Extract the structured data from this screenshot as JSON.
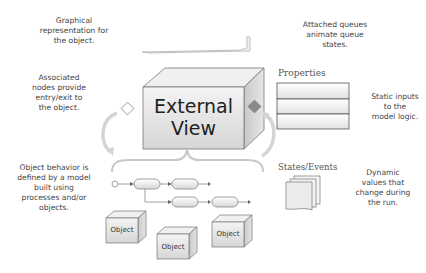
{
  "annotations": {
    "graphical": "Graphical representation for the object.",
    "associated_nodes": "Associated nodes provide entry/exit to the object.",
    "behavior": "Object behavior is defined by a model built using processes and/or objects.",
    "queues": "Attached queues animate queue states.",
    "static_inputs": "Static inputs to the model logic.",
    "dynamic_values": "Dynamic values that change during the run."
  },
  "external_view": {
    "line1": "External",
    "line2": "View"
  },
  "properties": {
    "title": "Properties",
    "rows": 3
  },
  "states_events": {
    "title": "States/Events"
  },
  "objects": [
    "Object",
    "Object",
    "Object"
  ],
  "colors": {
    "line": "#888888",
    "box_fill": "#e6e6e6",
    "output_node": "#888888",
    "input_node": "#ffffff"
  }
}
